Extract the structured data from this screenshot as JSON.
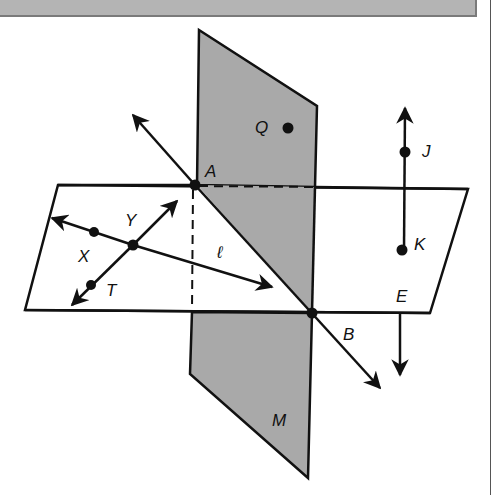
{
  "figure": {
    "colors": {
      "plane_M_fill": "#a9a9a9",
      "horizontal_plane_fill": "#ffffff",
      "stroke": "#111111",
      "header_bar": "#b4b4b4"
    },
    "planes": [
      {
        "name": "M",
        "label": "M"
      },
      {
        "name": "horizontal-plane",
        "label": ""
      }
    ],
    "points": {
      "A": "A",
      "B": "B",
      "Q": "Q",
      "J": "J",
      "K": "K",
      "E": "E",
      "X": "X",
      "Y": "Y",
      "T": "T"
    },
    "lines": {
      "l": "ℓ"
    }
  }
}
